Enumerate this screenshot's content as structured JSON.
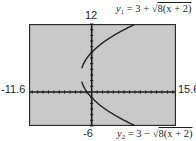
{
  "window": {
    "xmin": "-11.6",
    "xmax": "15.6",
    "ymin": "-6",
    "ymax": "12"
  },
  "equations": {
    "y1": {
      "name": "y",
      "index": "1",
      "lhs_rest": " = 3 + ",
      "sqrt_sign": "√",
      "radicand": "8(x + 2)"
    },
    "y2": {
      "name": "y",
      "index": "2",
      "lhs_rest": " = 3 − ",
      "sqrt_sign": "√",
      "radicand": "8(x + 2)"
    }
  },
  "colors": {
    "screen_bg": "#c9c9c9",
    "frame": "#2a2a2a",
    "axis": "#1a1a1a",
    "curve": "#222222"
  },
  "chart_data": {
    "type": "line",
    "title": "",
    "xlabel": "",
    "ylabel": "",
    "xlim": [
      -11.6,
      15.6
    ],
    "ylim": [
      -6,
      12
    ],
    "grid": false,
    "axis_ticks": true,
    "x_tick_step": 1,
    "y_tick_step": 1,
    "legend": [
      "y1 = 3 + √8(x + 2)",
      "y2 = 3 − √8(x + 2)"
    ],
    "window_labels": {
      "left": "-11.6",
      "right": "15.6",
      "top": "12",
      "bottom": "-6"
    },
    "series": [
      {
        "name": "y1 = 3 + √8(x + 2)",
        "sign": 1,
        "x": [
          -1.8,
          -1.5,
          -1,
          0,
          1,
          2,
          3,
          4,
          5,
          6,
          7,
          7.9
        ],
        "values": [
          4.26,
          5.0,
          5.83,
          7.0,
          7.9,
          8.66,
          9.32,
          9.93,
          10.48,
          11.0,
          11.49,
          11.9
        ]
      },
      {
        "name": "y2 = 3 − √8(x + 2)",
        "sign": -1,
        "x": [
          -1.8,
          -1.5,
          -1,
          0,
          1,
          2,
          3,
          4,
          5,
          6,
          7,
          7.9
        ],
        "values": [
          1.74,
          1.0,
          0.17,
          -1.0,
          -1.9,
          -2.66,
          -3.32,
          -3.93,
          -4.48,
          -5.0,
          -5.49,
          -5.9
        ]
      }
    ],
    "annotations": [
      "vertex at (-2, 3)"
    ]
  }
}
